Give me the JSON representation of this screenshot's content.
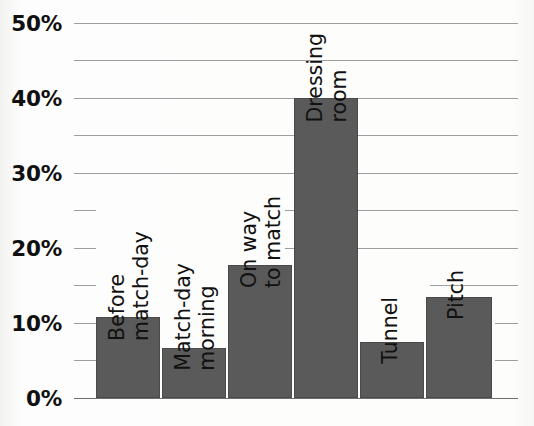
{
  "chart_data": {
    "type": "bar",
    "title": "",
    "subtitle": "",
    "xlabel": "",
    "ylabel": "",
    "categories": [
      "Before match-day",
      "Match-day morning",
      "On way to match",
      "Dressing room",
      "Tunnel",
      "Pitch"
    ],
    "category_lines": [
      [
        "Before",
        "match-day"
      ],
      [
        "Match-day",
        "morning"
      ],
      [
        "On way",
        "to match"
      ],
      [
        "Dressing",
        "room"
      ],
      [
        "Tunnel"
      ],
      [
        "Pitch"
      ]
    ],
    "values": [
      10.8,
      6.7,
      17.8,
      40.0,
      7.5,
      13.5
    ],
    "ylim": [
      0,
      50
    ],
    "ytick_values": [
      0,
      5,
      10,
      15,
      20,
      25,
      30,
      35,
      40,
      45,
      50
    ],
    "ytick_major_values": [
      0,
      10,
      20,
      30,
      40,
      50
    ],
    "ytick_major_labels": [
      "0%",
      "10%",
      "20%",
      "30%",
      "40%",
      "50%"
    ],
    "grid": true,
    "legend": "none",
    "bar_color": "#5a5a5a",
    "grid_color": "#8d8d8d",
    "axis_color": "#6f6f6f",
    "background_color": "#fdfdfb",
    "text_color": "#101010"
  }
}
